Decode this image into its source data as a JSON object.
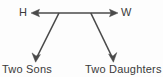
{
  "diagram": {
    "type": "family-tree",
    "background_color": "#fdfdfd",
    "stroke_color": "#4a4a4a",
    "text_color": "#3a3a3a",
    "nodes": {
      "husband": {
        "label": "H",
        "x": 24,
        "y": 13
      },
      "wife": {
        "label": "W",
        "x": 127,
        "y": 13
      },
      "sons": {
        "label": "Two Sons",
        "x": 30,
        "y": 69
      },
      "daughters": {
        "label": "Two Daughters",
        "x": 123,
        "y": 69
      }
    },
    "edges": [
      {
        "name": "husband-wife-link",
        "from": "husband",
        "to": "wife",
        "arrowheads": "both",
        "x1": 31,
        "y1": 13,
        "x2": 118,
        "y2": 13
      },
      {
        "name": "parents-to-sons",
        "from": "parents-junction-left",
        "to": "sons",
        "arrowheads": "end",
        "x1": 59,
        "y1": 13,
        "x2": 36,
        "y2": 61
      },
      {
        "name": "parents-to-daughters",
        "from": "parents-junction-right",
        "to": "daughters",
        "arrowheads": "end",
        "x1": 91,
        "y1": 13,
        "x2": 113,
        "y2": 61
      }
    ]
  }
}
